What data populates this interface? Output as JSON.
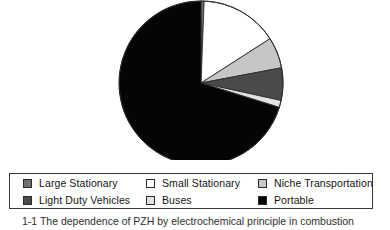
{
  "figure": {
    "caption": "1-1 The dependence of PZH by electrochemical principle in combustion"
  },
  "colors": {
    "large_stationary": "#707070",
    "small_stationary": "#ffffff",
    "niche_transportation": "#c6c6c6",
    "light_duty_vehicles": "#4a4a4a",
    "buses": "#e2e2e2",
    "portable": "#050505",
    "outline": "#2b2b2b",
    "legend_border": "#3a3a3a",
    "background": "#ffffff"
  },
  "legend": {
    "rows": [
      {
        "items": [
          {
            "label": "Large Stationary",
            "color": "#707070",
            "swatch_name": "swatch-large-stationary"
          },
          {
            "label": "Small Stationary",
            "color": "#ffffff",
            "swatch_name": "swatch-small-stationary"
          },
          {
            "label": "Niche Transportation",
            "color": "#c6c6c6",
            "swatch_name": "swatch-niche-transportation"
          }
        ]
      },
      {
        "items": [
          {
            "label": "Light Duty Vehicles",
            "color": "#4a4a4a",
            "swatch_name": "swatch-light-duty-vehicles"
          },
          {
            "label": "Buses",
            "color": "#e2e2e2",
            "swatch_name": "swatch-buses"
          },
          {
            "label": "Portable",
            "color": "#050505",
            "swatch_name": "swatch-portable"
          }
        ]
      }
    ]
  },
  "chart_data": {
    "type": "pie",
    "title": "",
    "legend_position": "bottom",
    "grid": false,
    "start_angle_deg": 0,
    "direction": "clockwise",
    "center": {
      "x": 201,
      "y": 83
    },
    "radius": 82,
    "labels": [
      "Large Stationary",
      "Small Stationary",
      "Niche Transportation",
      "Light Duty Vehicles",
      "Buses",
      "Portable"
    ],
    "values": [
      0.6,
      15.3,
      6.1,
      6.4,
      1.4,
      70.2
    ],
    "units": "percent",
    "angles_deg": [
      2.2,
      55.1,
      22.0,
      23.0,
      5.0,
      252.7
    ],
    "slice_colors": [
      "#707070",
      "#ffffff",
      "#c6c6c6",
      "#4a4a4a",
      "#e2e2e2",
      "#050505"
    ],
    "annotations": []
  }
}
